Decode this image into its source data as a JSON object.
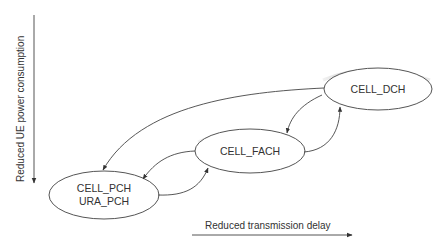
{
  "diagram": {
    "states": [
      {
        "id": "cell_dch",
        "label": "CELL_DCH"
      },
      {
        "id": "cell_fach",
        "label": "CELL_FACH"
      },
      {
        "id": "cell_pch_ura_pch",
        "label_line1": "CELL_PCH",
        "label_line2": "URA_PCH"
      }
    ],
    "transitions": [
      {
        "from": "CELL_DCH",
        "to": "CELL_PCH / URA_PCH"
      },
      {
        "from": "CELL_DCH",
        "to": "CELL_FACH"
      },
      {
        "from": "CELL_FACH",
        "to": "CELL_DCH"
      },
      {
        "from": "CELL_FACH",
        "to": "CELL_PCH / URA_PCH"
      },
      {
        "from": "CELL_PCH / URA_PCH",
        "to": "CELL_FACH"
      }
    ],
    "axes": {
      "vertical_label": "Reduced UE power consumption",
      "horizontal_label": "Reduced transmission delay"
    },
    "colors": {
      "stroke": "#444444",
      "shadow": "#9a9a9a",
      "text": "#333333"
    }
  }
}
